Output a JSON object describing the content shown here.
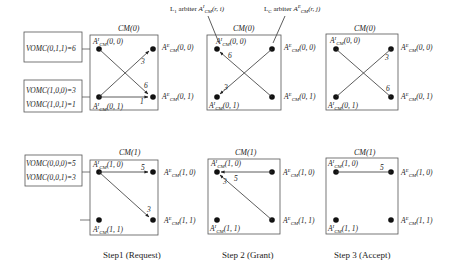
{
  "figure": {
    "arbiter_labels": {
      "input": {
        "prefix": "L",
        "prefix_sub": "1",
        "word": "arbiter",
        "sym": "A",
        "sup": "I",
        "sub": "CM",
        "args": "(r, i)"
      },
      "output": {
        "prefix": "L",
        "prefix_sub": "C",
        "word": "arbiter",
        "sym": "A",
        "sup": "E",
        "sub": "CM",
        "args": "(r, j)"
      }
    },
    "steps": [
      {
        "label": "Step1 (Request)"
      },
      {
        "label": "Step 2 (Grant)"
      },
      {
        "label": "Step 3 (Accept)"
      }
    ],
    "rows": [
      {
        "module": "CM(0)",
        "vomc_top": [
          "VOMC(0,1,1)=6"
        ],
        "vomc_bottom": [
          "VOMC(1,0,0)=3",
          "VOMC(1,0,1)=1"
        ],
        "inputs": [
          "(0, 0)",
          "(0, 1)"
        ],
        "outputs": [
          "(0, 0)",
          "(0, 1)"
        ],
        "edge_weights": {
          "step1": {
            "a": "3",
            "b": "6",
            "c": "1"
          },
          "step2": {
            "a": "6",
            "b": "3"
          },
          "step3": {
            "a": "3",
            "b": "6"
          }
        }
      },
      {
        "module": "CM(1)",
        "vomc_top": [
          "VOMC(0,0,0)=5",
          "VOMC(0,0,1)=3"
        ],
        "vomc_bottom": [],
        "inputs": [
          "(1, 0)",
          "(1, 1)"
        ],
        "outputs": [
          "(1, 0)",
          "(1, 1)"
        ],
        "edge_weights": {
          "step1": {
            "a": "5",
            "b": "3"
          },
          "step2": {
            "a": "5",
            "b": "3"
          },
          "step3": {
            "a": "5"
          }
        }
      }
    ],
    "colors": {
      "line": "#333333",
      "box": "#555555",
      "text": "#222222"
    }
  }
}
